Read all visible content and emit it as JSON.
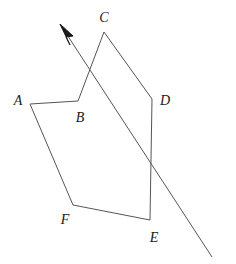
{
  "figure": {
    "type": "geometry-diagram",
    "canvas": {
      "width": 236,
      "height": 264
    },
    "style": {
      "background_color": "#ffffff",
      "stroke_color": "#555555",
      "label_color": "#1a1a1a",
      "stroke_width": 1
    },
    "polygon": {
      "name": "hexagon-abcdef",
      "closed": true,
      "points": "30,104 78,101 104,32 152,99 150,220 73,205"
    },
    "ray": {
      "name": "transversal-ray",
      "from": {
        "x": 212,
        "y": 257
      },
      "to": {
        "x": 60,
        "y": 24
      },
      "arrowhead_at": "to",
      "path": "M 212,257 L 60,24"
    },
    "arrowhead": {
      "points": "60,24 73,36 66,37 70,45"
    },
    "vertices": [
      {
        "id": "A",
        "label": "A",
        "x": 30,
        "y": 104,
        "label_x": 18,
        "label_y": 101
      },
      {
        "id": "B",
        "label": "B",
        "x": 78,
        "y": 101,
        "label_x": 80,
        "label_y": 118
      },
      {
        "id": "C",
        "label": "C",
        "x": 104,
        "y": 32,
        "label_x": 104,
        "label_y": 18
      },
      {
        "id": "D",
        "label": "D",
        "x": 152,
        "y": 99,
        "label_x": 165,
        "label_y": 101
      },
      {
        "id": "E",
        "label": "E",
        "x": 150,
        "y": 220,
        "label_x": 154,
        "label_y": 238
      },
      {
        "id": "F",
        "label": "F",
        "x": 73,
        "y": 205,
        "label_x": 65,
        "label_y": 220
      }
    ]
  }
}
